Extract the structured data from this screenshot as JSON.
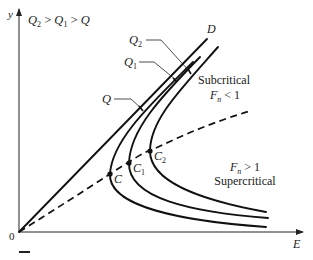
{
  "figure": {
    "type": "specific-energy diagram",
    "condition_label": {
      "a": "Q",
      "sub_a": "2",
      "gt1": " > ",
      "b": "Q",
      "sub_b": "1",
      "gt2": " > ",
      "c": "Q"
    },
    "axes": {
      "y_label": "y",
      "x_label": "E",
      "origin_label": "0"
    },
    "lines": {
      "depth_line_label": "D"
    },
    "curves": [
      {
        "name": "Q",
        "label": "Q",
        "sub": "",
        "critical_point": "C",
        "critical_sub": ""
      },
      {
        "name": "Q1",
        "label": "Q",
        "sub": "1",
        "critical_point": "C",
        "critical_sub": "1"
      },
      {
        "name": "Q2",
        "label": "Q",
        "sub": "2",
        "critical_point": "C",
        "critical_sub": "2"
      }
    ],
    "regions": {
      "subcritical": {
        "title": "Subcritical",
        "f": "F",
        "f_sub": "n",
        "relation": " < 1"
      },
      "supercritical": {
        "title": "Supercritical",
        "f": "F",
        "f_sub": "n",
        "relation": " > 1"
      }
    },
    "colors": {
      "ink": "#111111",
      "background": "#ffffff"
    }
  }
}
